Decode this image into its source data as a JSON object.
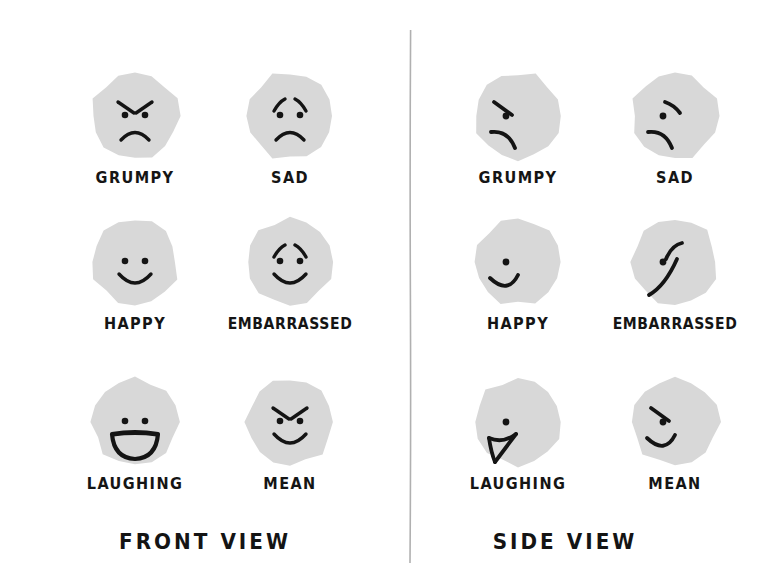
{
  "sheet": {
    "title": "Emotion Face Reference Sheet",
    "background_color": "#ffffff",
    "ink_color": "#141414",
    "face_fill_color": "#d8d8d8",
    "divider_color": "#b0b0b0"
  },
  "views": [
    {
      "key": "front",
      "title": "FRONT VIEW",
      "faces": [
        {
          "label": "GRUMPY",
          "row": 0,
          "col": 0,
          "brows": "angry-v",
          "eyes": "two-dots",
          "mouth": "frown"
        },
        {
          "label": "SAD",
          "row": 0,
          "col": 1,
          "brows": "worried",
          "eyes": "two-dots",
          "mouth": "frown"
        },
        {
          "label": "HAPPY",
          "row": 1,
          "col": 0,
          "brows": "none",
          "eyes": "two-dots",
          "mouth": "smile"
        },
        {
          "label": "EMBARRASSED",
          "row": 1,
          "col": 1,
          "brows": "worried",
          "eyes": "two-dots",
          "mouth": "smile"
        },
        {
          "label": "LAUGHING",
          "row": 2,
          "col": 0,
          "brows": "none",
          "eyes": "two-dots",
          "mouth": "open-laugh"
        },
        {
          "label": "MEAN",
          "row": 2,
          "col": 1,
          "brows": "angry-v",
          "eyes": "two-dots",
          "mouth": "smile"
        }
      ]
    },
    {
      "key": "side",
      "title": "SIDE VIEW",
      "faces": [
        {
          "label": "GRUMPY",
          "row": 0,
          "col": 0,
          "brows": "angry-slant",
          "eyes": "one-dot",
          "mouth": "frown-profile"
        },
        {
          "label": "SAD",
          "row": 0,
          "col": 1,
          "brows": "sad-slant",
          "eyes": "one-dot",
          "mouth": "frown-profile"
        },
        {
          "label": "HAPPY",
          "row": 1,
          "col": 0,
          "brows": "none",
          "eyes": "one-dot",
          "mouth": "smile-profile"
        },
        {
          "label": "EMBARRASSED",
          "row": 1,
          "col": 1,
          "brows": "raised",
          "eyes": "one-dot",
          "mouth": "smile-profile-long"
        },
        {
          "label": "LAUGHING",
          "row": 2,
          "col": 0,
          "brows": "none",
          "eyes": "one-dot",
          "mouth": "open-laugh-profile"
        },
        {
          "label": "MEAN",
          "row": 2,
          "col": 1,
          "brows": "angry-slant",
          "eyes": "one-dot",
          "mouth": "smile-profile"
        }
      ]
    }
  ]
}
